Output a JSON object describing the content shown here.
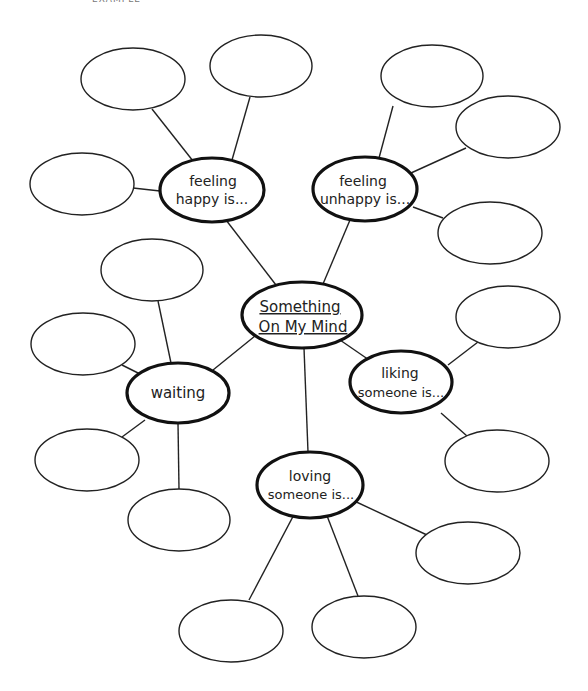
{
  "header": {
    "text": "EXAMPLE"
  },
  "diagram": {
    "type": "web / mind-map",
    "center": {
      "line1": "Something",
      "line2": "On My Mind",
      "underlined": true
    },
    "branches": [
      {
        "id": "feeling-happy",
        "line1": "feeling",
        "line2": "happy is...",
        "empty_bubbles": 3
      },
      {
        "id": "feeling-unhappy",
        "line1": "feeling",
        "line2": "unhappy is...",
        "empty_bubbles": 3
      },
      {
        "id": "waiting",
        "line1": "waiting",
        "line2": "",
        "empty_bubbles": 4
      },
      {
        "id": "liking-someone",
        "line1": "liking",
        "line2": "someone is...",
        "empty_bubbles": 2
      },
      {
        "id": "loving-someone",
        "line1": "loving",
        "line2": "someone is...",
        "empty_bubbles": 3
      }
    ]
  },
  "colors": {
    "stroke": "#222222",
    "background": "#ffffff"
  }
}
